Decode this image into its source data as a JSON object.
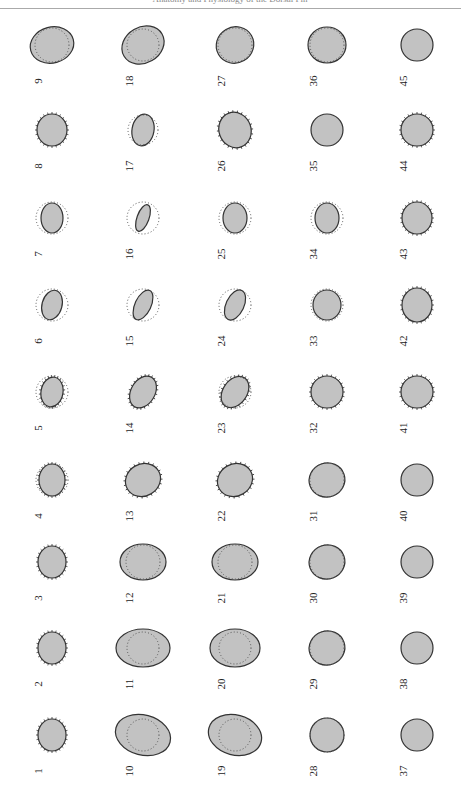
{
  "header": {
    "running_text": "Anatomy and Physiology of the Dorsal Fin"
  },
  "colors": {
    "fill": "#c2c2c2",
    "stroke": "#333333",
    "dots": "#555555"
  },
  "columns_x": [
    52,
    143,
    235,
    327,
    417
  ],
  "rows_y": [
    45,
    130,
    218,
    305,
    392,
    480,
    562,
    648,
    735
  ],
  "cells": [
    {
      "n": "9",
      "col": 0,
      "row": 0,
      "rx": 22,
      "ry": 18,
      "rot": -15,
      "inner": 17,
      "texture": "none"
    },
    {
      "n": "18",
      "col": 1,
      "row": 0,
      "rx": 22,
      "ry": 18,
      "rot": -30,
      "inner": 16,
      "texture": "none"
    },
    {
      "n": "27",
      "col": 2,
      "row": 0,
      "rx": 19,
      "ry": 18,
      "rot": -30,
      "inner": 17,
      "texture": "none"
    },
    {
      "n": "36",
      "col": 3,
      "row": 0,
      "rx": 19,
      "ry": 18,
      "rot": 0,
      "inner": 17,
      "texture": "none"
    },
    {
      "n": "45",
      "col": 4,
      "row": 0,
      "rx": 16,
      "ry": 16,
      "rot": 0,
      "inner": 0,
      "texture": "none"
    },
    {
      "n": "8",
      "col": 0,
      "row": 1,
      "rx": 15,
      "ry": 16,
      "rot": 0,
      "inner": 0,
      "texture": "spiky"
    },
    {
      "n": "17",
      "col": 1,
      "row": 1,
      "rx": 11,
      "ry": 16,
      "rot": 10,
      "inner": 15,
      "texture": "none"
    },
    {
      "n": "26",
      "col": 2,
      "row": 1,
      "rx": 16,
      "ry": 18,
      "rot": -20,
      "inner": 0,
      "texture": "spiky"
    },
    {
      "n": "35",
      "col": 3,
      "row": 1,
      "rx": 16,
      "ry": 16,
      "rot": 0,
      "inner": 0,
      "texture": "none"
    },
    {
      "n": "44",
      "col": 4,
      "row": 1,
      "rx": 16,
      "ry": 16,
      "rot": 0,
      "inner": 0,
      "texture": "spiky"
    },
    {
      "n": "7",
      "col": 0,
      "row": 2,
      "rx": 11,
      "ry": 15,
      "rot": 0,
      "inner": 16,
      "texture": "none"
    },
    {
      "n": "16",
      "col": 1,
      "row": 2,
      "rx": 6,
      "ry": 14,
      "rot": 20,
      "inner": 16,
      "texture": "none"
    },
    {
      "n": "25",
      "col": 2,
      "row": 2,
      "rx": 12,
      "ry": 15,
      "rot": 0,
      "inner": 16,
      "texture": "none"
    },
    {
      "n": "34",
      "col": 3,
      "row": 2,
      "rx": 12,
      "ry": 15,
      "rot": 0,
      "inner": 16,
      "texture": "none"
    },
    {
      "n": "43",
      "col": 4,
      "row": 2,
      "rx": 15,
      "ry": 16,
      "rot": 0,
      "inner": 0,
      "texture": "spiky"
    },
    {
      "n": "6",
      "col": 0,
      "row": 3,
      "rx": 10,
      "ry": 15,
      "rot": 15,
      "inner": 16,
      "texture": "none"
    },
    {
      "n": "15",
      "col": 1,
      "row": 3,
      "rx": 8,
      "ry": 16,
      "rot": 25,
      "inner": 16,
      "texture": "none"
    },
    {
      "n": "24",
      "col": 2,
      "row": 3,
      "rx": 9,
      "ry": 16,
      "rot": 25,
      "inner": 16,
      "texture": "none"
    },
    {
      "n": "33",
      "col": 3,
      "row": 3,
      "rx": 14,
      "ry": 15,
      "rot": 0,
      "inner": 16,
      "texture": "none"
    },
    {
      "n": "42",
      "col": 4,
      "row": 3,
      "rx": 15,
      "ry": 17,
      "rot": 0,
      "inner": 0,
      "texture": "spiky"
    },
    {
      "n": "5",
      "col": 0,
      "row": 4,
      "rx": 11,
      "ry": 15,
      "rot": 10,
      "inner": 16,
      "texture": "spiky"
    },
    {
      "n": "14",
      "col": 1,
      "row": 4,
      "rx": 12,
      "ry": 17,
      "rot": 30,
      "inner": 0,
      "texture": "spiky"
    },
    {
      "n": "23",
      "col": 2,
      "row": 4,
      "rx": 12,
      "ry": 17,
      "rot": 35,
      "inner": 16,
      "texture": "spiky"
    },
    {
      "n": "32",
      "col": 3,
      "row": 4,
      "rx": 16,
      "ry": 16,
      "rot": 0,
      "inner": 0,
      "texture": "spiky"
    },
    {
      "n": "41",
      "col": 4,
      "row": 4,
      "rx": 16,
      "ry": 16,
      "rot": 0,
      "inner": 0,
      "texture": "spiky"
    },
    {
      "n": "4",
      "col": 0,
      "row": 5,
      "rx": 13,
      "ry": 16,
      "rot": 0,
      "inner": 16,
      "texture": "spiky"
    },
    {
      "n": "13",
      "col": 1,
      "row": 5,
      "rx": 18,
      "ry": 16,
      "rot": -30,
      "inner": 0,
      "texture": "spiky"
    },
    {
      "n": "22",
      "col": 2,
      "row": 5,
      "rx": 18,
      "ry": 16,
      "rot": -30,
      "inner": 0,
      "texture": "spiky"
    },
    {
      "n": "31",
      "col": 3,
      "row": 5,
      "rx": 18,
      "ry": 17,
      "rot": -20,
      "inner": 17,
      "texture": "none"
    },
    {
      "n": "40",
      "col": 4,
      "row": 5,
      "rx": 16,
      "ry": 16,
      "rot": 0,
      "inner": 0,
      "texture": "none"
    },
    {
      "n": "3",
      "col": 0,
      "row": 6,
      "rx": 14,
      "ry": 16,
      "rot": 0,
      "inner": 0,
      "texture": "spiky"
    },
    {
      "n": "12",
      "col": 1,
      "row": 6,
      "rx": 23,
      "ry": 18,
      "rot": 0,
      "inner": 17,
      "texture": "none"
    },
    {
      "n": "21",
      "col": 2,
      "row": 6,
      "rx": 23,
      "ry": 18,
      "rot": 0,
      "inner": 17,
      "texture": "none"
    },
    {
      "n": "30",
      "col": 3,
      "row": 6,
      "rx": 18,
      "ry": 17,
      "rot": -20,
      "inner": 17,
      "texture": "none"
    },
    {
      "n": "39",
      "col": 4,
      "row": 6,
      "rx": 16,
      "ry": 16,
      "rot": 0,
      "inner": 0,
      "texture": "none"
    },
    {
      "n": "2",
      "col": 0,
      "row": 7,
      "rx": 14,
      "ry": 16,
      "rot": 0,
      "inner": 0,
      "texture": "spiky"
    },
    {
      "n": "11",
      "col": 1,
      "row": 7,
      "rx": 27,
      "ry": 19,
      "rot": 0,
      "inner": 16,
      "texture": "none"
    },
    {
      "n": "20",
      "col": 2,
      "row": 7,
      "rx": 25,
      "ry": 19,
      "rot": 0,
      "inner": 16,
      "texture": "none"
    },
    {
      "n": "29",
      "col": 3,
      "row": 7,
      "rx": 18,
      "ry": 17,
      "rot": -20,
      "inner": 17,
      "texture": "none"
    },
    {
      "n": "38",
      "col": 4,
      "row": 7,
      "rx": 16,
      "ry": 16,
      "rot": 0,
      "inner": 0,
      "texture": "none"
    },
    {
      "n": "1",
      "col": 0,
      "row": 8,
      "rx": 14,
      "ry": 16,
      "rot": 0,
      "inner": 0,
      "texture": "spiky"
    },
    {
      "n": "10",
      "col": 1,
      "row": 8,
      "rx": 28,
      "ry": 20,
      "rot": 15,
      "inner": 16,
      "texture": "none"
    },
    {
      "n": "19",
      "col": 2,
      "row": 8,
      "rx": 27,
      "ry": 20,
      "rot": 15,
      "inner": 16,
      "texture": "none"
    },
    {
      "n": "28",
      "col": 3,
      "row": 8,
      "rx": 17,
      "ry": 17,
      "rot": 0,
      "inner": 17,
      "texture": "none"
    },
    {
      "n": "37",
      "col": 4,
      "row": 8,
      "rx": 16,
      "ry": 16,
      "rot": 0,
      "inner": 0,
      "texture": "none"
    }
  ]
}
